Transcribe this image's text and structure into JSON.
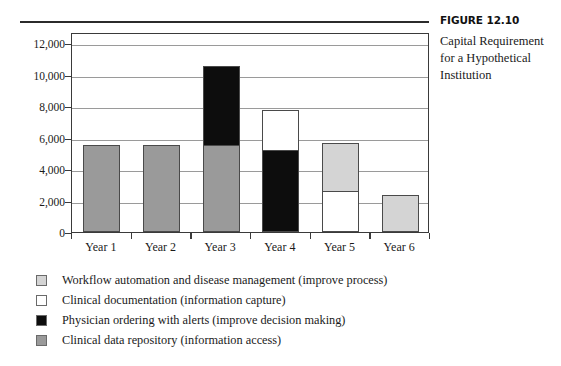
{
  "caption": {
    "figure_number": "FIGURE 12.10",
    "text": "Capital Requirement for a Hypothetical Institution"
  },
  "colors": {
    "workflow_automation": "#d4d4d4",
    "clinical_documentation": "#ffffff",
    "physician_ordering": "#0d0d0d",
    "clinical_data_repository": "#9a9a9a",
    "axis": "#3a3a3a",
    "gridline": "#9a9a9a"
  },
  "legend": {
    "items": [
      {
        "label": "Workflow automation and disease management (improve process)",
        "key": "workflow_automation"
      },
      {
        "label": "Clinical documentation (information capture)",
        "key": "clinical_documentation"
      },
      {
        "label": "Physician ordering with alerts (improve decision making)",
        "key": "physician_ordering"
      },
      {
        "label": "Clinical data repository (information access)",
        "key": "clinical_data_repository"
      }
    ]
  },
  "chart_data": {
    "type": "bar",
    "stacked": true,
    "title": "Capital Requirement for a Hypothetical Institution",
    "xlabel": "",
    "ylabel": "",
    "ylim": [
      0,
      12000
    ],
    "ytick_labels": [
      "0",
      "2,000",
      "4,000",
      "6,000",
      "8,000",
      "10,000",
      "12,000"
    ],
    "ytick_values": [
      0,
      2000,
      4000,
      6000,
      8000,
      10000,
      12000
    ],
    "grid": true,
    "legend_position": "below",
    "categories": [
      "Year 1",
      "Year 2",
      "Year 3",
      "Year 4",
      "Year 5",
      "Year 6"
    ],
    "series": [
      {
        "name": "Clinical data repository (information access)",
        "color": "#9a9a9a",
        "values": [
          5500,
          5500,
          5500,
          0,
          0,
          0
        ]
      },
      {
        "name": "Physician ordering with alerts (improve decision making)",
        "color": "#0d0d0d",
        "values": [
          0,
          0,
          5100,
          5200,
          0,
          0
        ]
      },
      {
        "name": "Clinical documentation (information capture)",
        "color": "#ffffff",
        "values": [
          0,
          0,
          0,
          2600,
          2600,
          0
        ]
      },
      {
        "name": "Workflow automation and disease management (improve process)",
        "color": "#d4d4d4",
        "values": [
          0,
          0,
          0,
          0,
          3100,
          2350
        ]
      }
    ],
    "totals": [
      5500,
      5500,
      10600,
      7800,
      5700,
      2350
    ]
  }
}
